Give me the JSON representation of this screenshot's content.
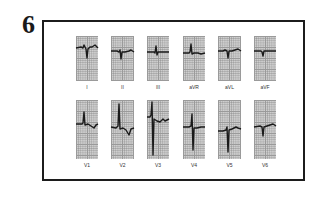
{
  "figure": {
    "number": "6"
  },
  "leads": {
    "row1": [
      {
        "label": "I",
        "x": 76,
        "w": 22,
        "y": 36,
        "h": 45,
        "wave": "M0,12 L5,11 L7,12 L8,9 L10,13 L11,22 L12,13 L14,11 L16,11 L19,9 L22,12"
      },
      {
        "label": "II",
        "x": 111,
        "w": 23,
        "y": 36,
        "h": 45,
        "wave": "M0,15 L6,15 L8,16 L9,14 L10,23 L11,16 L14,16 L18,15 L20,14 L23,16"
      },
      {
        "label": "III",
        "x": 147,
        "w": 22,
        "y": 36,
        "h": 45,
        "wave": "M0,16 L7,16 L8,17 L9,10 L10,19 L11,16 L15,16 L22,16"
      },
      {
        "label": "aVR",
        "x": 183,
        "w": 22,
        "y": 36,
        "h": 45,
        "wave": "M0,17 L6,17 L7,16 L8,8 L9,18 L11,17 L15,17 L18,18 L22,17"
      },
      {
        "label": "aVL",
        "x": 218,
        "w": 23,
        "y": 36,
        "h": 45,
        "wave": "M0,15 L5,15 L7,14 L9,15 L10,22 L11,15 L14,15 L17,14 L20,13 L23,15"
      },
      {
        "label": "aVF",
        "x": 254,
        "w": 22,
        "y": 36,
        "h": 45,
        "wave": "M0,15 L7,15 L8,16 L9,20 L10,15 L14,15 L22,15"
      }
    ],
    "row2": [
      {
        "label": "V1",
        "x": 76,
        "w": 22,
        "y": 100,
        "h": 59,
        "wave": "M0,24 L6,24 L7,23 L8,12 L9,25 L12,24 L15,26 L18,28 L20,25 L22,24"
      },
      {
        "label": "V2",
        "x": 111,
        "w": 23,
        "y": 100,
        "h": 59,
        "wave": "M0,27 L5,28 L7,26 L8,4 L9,29 L12,28 L15,30 L18,35 L20,29 L23,28"
      },
      {
        "label": "V3",
        "x": 147,
        "w": 22,
        "y": 100,
        "h": 59,
        "wave": "M0,17 L3,17 L4,15 L5,2 L6,55 L7,19 L10,21 L13,22 L16,19 L18,21 L22,19"
      },
      {
        "label": "V4",
        "x": 183,
        "w": 22,
        "y": 100,
        "h": 59,
        "wave": "M0,27 L6,27 L8,26 L9,14 L10,50 L11,28 L14,28 L18,27 L22,27"
      },
      {
        "label": "V5",
        "x": 218,
        "w": 23,
        "y": 100,
        "h": 59,
        "wave": "M0,31 L5,31 L8,30 L9,27 L10,52 L11,30 L14,29 L18,27 L20,28 L23,29"
      },
      {
        "label": "V6",
        "x": 254,
        "w": 22,
        "y": 100,
        "h": 59,
        "wave": "M0,27 L6,26 L8,27 L9,36 L10,27 L13,26 L16,25 L19,24 L22,26"
      }
    ]
  }
}
